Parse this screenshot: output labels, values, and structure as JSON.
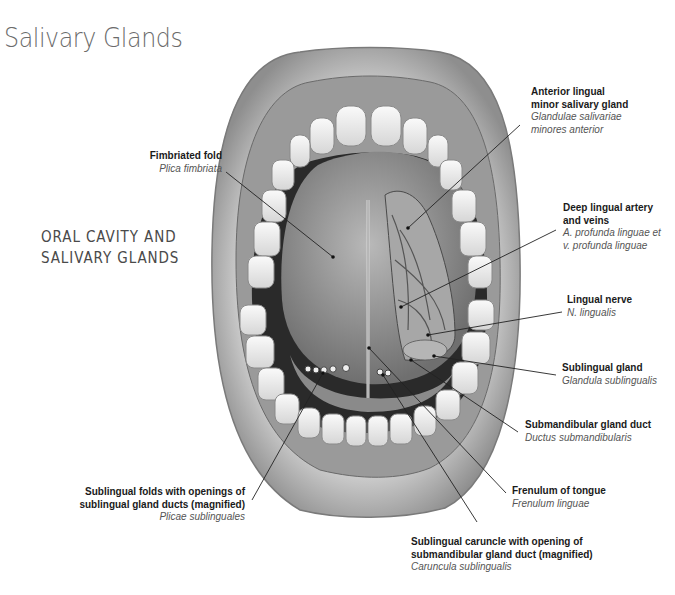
{
  "title": "Salivary Glands",
  "subtitle": {
    "line1": "ORAL CAVITY AND",
    "line2": "SALIVARY GLANDS"
  },
  "labels": [
    {
      "id": "fimbriated-fold",
      "en": [
        "Fimbriated fold"
      ],
      "la": [
        "Plica fimbriata"
      ]
    },
    {
      "id": "anterior-lingual-gland",
      "en": [
        "Anterior lingual",
        "minor salivary gland"
      ],
      "la": [
        "Glandulae salivariae",
        "minores anterior"
      ]
    },
    {
      "id": "deep-lingual-artery",
      "en": [
        "Deep lingual artery",
        "and veins"
      ],
      "la": [
        "A. profunda linguae et",
        "v. profunda linguae"
      ]
    },
    {
      "id": "lingual-nerve",
      "en": [
        "Lingual nerve"
      ],
      "la": [
        "N. lingualis"
      ]
    },
    {
      "id": "sublingual-gland",
      "en": [
        "Sublingual gland"
      ],
      "la": [
        "Glandula sublingualis"
      ]
    },
    {
      "id": "submandibular-duct",
      "en": [
        "Submandibular gland duct"
      ],
      "la": [
        "Ductus submandibularis"
      ]
    },
    {
      "id": "frenulum",
      "en": [
        "Frenulum of tongue"
      ],
      "la": [
        "Frenulum linguae"
      ]
    },
    {
      "id": "sublingual-caruncle",
      "en": [
        "Sublingual caruncle with opening of",
        "submandibular gland duct (magnified)"
      ],
      "la": [
        "Caruncula sublingualis"
      ]
    },
    {
      "id": "sublingual-folds",
      "en": [
        "Sublingual folds with openings of",
        "sublingual gland ducts (magnified)"
      ],
      "la": [
        "Plicae sublinguales"
      ]
    }
  ]
}
